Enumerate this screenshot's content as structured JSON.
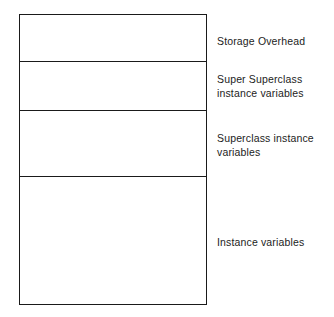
{
  "diagram": {
    "stroke_color": "#1a1a1a",
    "fill_color": "#ffffff",
    "text_color": "#1c1c1c",
    "background_color": "#ffffff",
    "segments": [
      {
        "id": "storage-overhead",
        "label": "Storage Overhead",
        "height_px": 47
      },
      {
        "id": "super-superclass-instance-variables",
        "label": "Super Superclass\ninstance variables",
        "height_px": 49
      },
      {
        "id": "superclass-instance-variables",
        "label": "Superclass instance\nvariables",
        "height_px": 66
      },
      {
        "id": "instance-variables",
        "label": "Instance variables",
        "height_px": 129
      }
    ]
  }
}
